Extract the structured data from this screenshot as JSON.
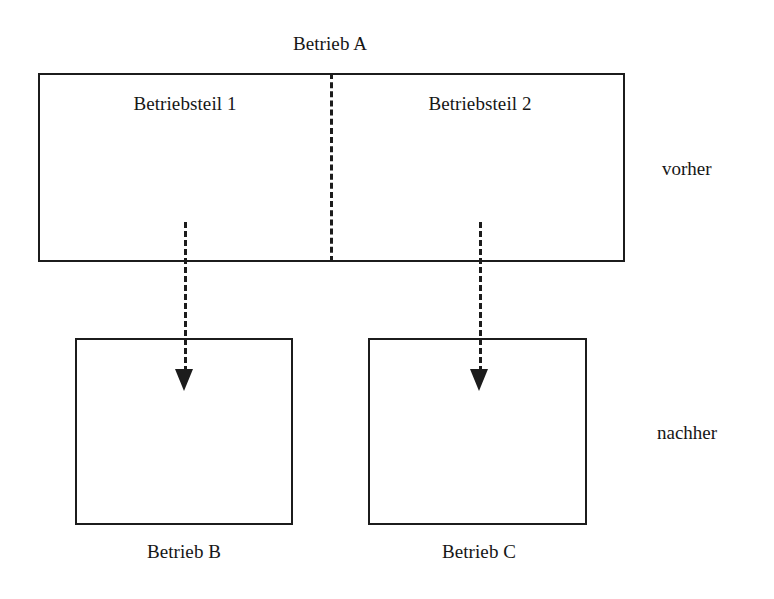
{
  "diagram": {
    "title_top": "Betrieb A",
    "top_box": {
      "label": "Betrieb A",
      "parts": [
        {
          "label": "Betriebsteil 1"
        },
        {
          "label": "Betriebsteil 2"
        }
      ]
    },
    "bottom_boxes": [
      {
        "label": "Betrieb B"
      },
      {
        "label": "Betrieb C"
      }
    ],
    "phase_labels": {
      "before": "vorher",
      "after": "nachher"
    },
    "colors": {
      "stroke": "#1c1c1c",
      "text": "#161616",
      "background": "#ffffff"
    }
  }
}
